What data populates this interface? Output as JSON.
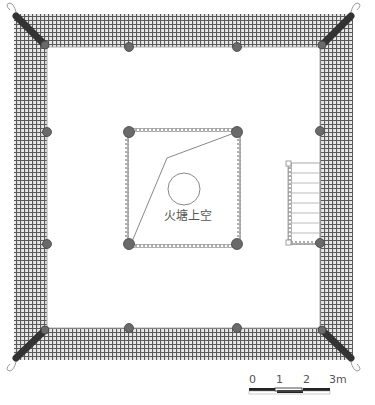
{
  "drawing": {
    "type": "architectural floor plan",
    "center_label": "火塘上空",
    "colors": {
      "hatch": "#555555",
      "column": "#666666",
      "rafter": "#333333",
      "line": "#888888",
      "background": "#ffffff"
    },
    "columns_outer": [
      {
        "x": 129,
        "y": 47
      },
      {
        "x": 237,
        "y": 47
      },
      {
        "x": 47,
        "y": 132
      },
      {
        "x": 47,
        "y": 244
      },
      {
        "x": 320,
        "y": 131
      },
      {
        "x": 320,
        "y": 243
      },
      {
        "x": 129,
        "y": 328
      },
      {
        "x": 237,
        "y": 328
      }
    ],
    "columns_inner": [
      {
        "x": 129,
        "y": 132
      },
      {
        "x": 237,
        "y": 132
      },
      {
        "x": 129,
        "y": 244
      },
      {
        "x": 237,
        "y": 244
      }
    ],
    "stair_steps": 8
  },
  "scale_bar": {
    "ticks": [
      "0",
      "1",
      "2",
      "3m"
    ]
  }
}
